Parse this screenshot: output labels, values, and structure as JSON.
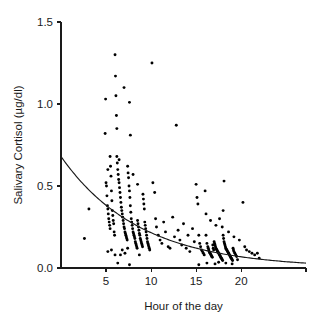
{
  "chart_data": {
    "type": "scatter",
    "title": "",
    "xlabel": "Hour of the day",
    "ylabel": "Salivary Cortisol (µg/dl)",
    "xlim": [
      0,
      27.2
    ],
    "ylim": [
      0.0,
      1.5
    ],
    "xticks": [
      5,
      10,
      15,
      20
    ],
    "xtick_labels": [
      "5",
      "10",
      "15",
      "20"
    ],
    "yticks": [
      0.0,
      0.5,
      1.0,
      1.5
    ],
    "ytick_labels": [
      "0.0",
      "0.5",
      "1.0",
      "1.5"
    ],
    "grid": false,
    "legend": "none",
    "marker": "filled-circle",
    "marker_color": "#000000",
    "fit_curve": {
      "label": "",
      "type": "exponential-decay",
      "color": "#1a1a1a",
      "equation": "y = 0.68 * exp(-0.115 * x)",
      "amplitude": 0.68,
      "decay_rate": 0.115,
      "x_start": 0,
      "x_end": 27.2,
      "y_start": 0.68,
      "y_end": 0.03
    },
    "series": [
      {
        "name": "Salivary cortisol samples",
        "points": [
          [
            2.6,
            0.18
          ],
          [
            3.1,
            0.36
          ],
          [
            4.9,
            0.82
          ],
          [
            4.95,
            1.03
          ],
          [
            5.0,
            0.52
          ],
          [
            5.05,
            0.5
          ],
          [
            5.1,
            0.44
          ],
          [
            5.15,
            0.38
          ],
          [
            5.2,
            0.36
          ],
          [
            5.25,
            0.33
          ],
          [
            5.3,
            0.3
          ],
          [
            5.35,
            0.28
          ],
          [
            5.4,
            0.26
          ],
          [
            5.45,
            0.24
          ],
          [
            5.5,
            0.62
          ],
          [
            5.55,
            0.56
          ],
          [
            5.6,
            0.47
          ],
          [
            5.65,
            0.41
          ],
          [
            5.7,
            0.35
          ],
          [
            5.75,
            0.32
          ],
          [
            5.8,
            0.29
          ],
          [
            5.85,
            0.27
          ],
          [
            5.9,
            0.22
          ],
          [
            5.95,
            0.2
          ],
          [
            6.0,
            1.3
          ],
          [
            6.05,
            1.17
          ],
          [
            6.1,
            1.05
          ],
          [
            6.15,
            0.93
          ],
          [
            6.2,
            0.85
          ],
          [
            6.25,
            0.64
          ],
          [
            6.3,
            0.6
          ],
          [
            6.35,
            0.57
          ],
          [
            6.4,
            0.54
          ],
          [
            6.45,
            0.52
          ],
          [
            6.5,
            0.49
          ],
          [
            6.55,
            0.46
          ],
          [
            6.6,
            0.43
          ],
          [
            6.65,
            0.4
          ],
          [
            6.7,
            0.37
          ],
          [
            6.75,
            0.35
          ],
          [
            6.8,
            0.33
          ],
          [
            6.85,
            0.31
          ],
          [
            6.9,
            0.29
          ],
          [
            6.95,
            0.27
          ],
          [
            7.0,
            0.25
          ],
          [
            7.05,
            0.24
          ],
          [
            7.1,
            0.22
          ],
          [
            7.15,
            0.21
          ],
          [
            7.2,
            0.2
          ],
          [
            7.25,
            0.19
          ],
          [
            7.3,
            0.18
          ],
          [
            7.35,
            0.17
          ],
          [
            7.4,
            0.62
          ],
          [
            7.45,
            0.58
          ],
          [
            7.5,
            0.55
          ],
          [
            7.55,
            0.5
          ],
          [
            7.6,
            0.47
          ],
          [
            7.65,
            0.43
          ],
          [
            7.7,
            0.38
          ],
          [
            7.75,
            0.34
          ],
          [
            7.8,
            0.3
          ],
          [
            7.85,
            0.28
          ],
          [
            7.9,
            0.26
          ],
          [
            7.95,
            0.24
          ],
          [
            8.0,
            0.22
          ],
          [
            8.05,
            0.21
          ],
          [
            8.1,
            0.2
          ],
          [
            8.15,
            0.19
          ],
          [
            8.2,
            0.18
          ],
          [
            8.25,
            0.16
          ],
          [
            8.3,
            0.15
          ],
          [
            8.35,
            0.14
          ],
          [
            8.4,
            0.13
          ],
          [
            8.45,
            0.12
          ],
          [
            8.5,
            0.29
          ],
          [
            8.55,
            0.27
          ],
          [
            8.6,
            0.25
          ],
          [
            8.65,
            0.23
          ],
          [
            8.7,
            0.21
          ],
          [
            8.75,
            0.2
          ],
          [
            8.8,
            0.18
          ],
          [
            8.85,
            0.17
          ],
          [
            8.9,
            0.16
          ],
          [
            8.95,
            0.15
          ],
          [
            9.0,
            0.14
          ],
          [
            9.05,
            0.13
          ],
          [
            9.1,
            0.45
          ],
          [
            9.15,
            0.42
          ],
          [
            9.2,
            0.39
          ],
          [
            9.25,
            0.36
          ],
          [
            9.3,
            0.28
          ],
          [
            9.35,
            0.26
          ],
          [
            9.4,
            0.24
          ],
          [
            9.45,
            0.22
          ],
          [
            9.5,
            0.2
          ],
          [
            9.55,
            0.18
          ],
          [
            9.6,
            0.16
          ],
          [
            9.65,
            0.15
          ],
          [
            9.7,
            0.14
          ],
          [
            9.75,
            0.13
          ],
          [
            9.8,
            0.12
          ],
          [
            9.85,
            0.11
          ],
          [
            6.3,
            0.03
          ],
          [
            7.6,
            0.02
          ],
          [
            6.0,
            0.08
          ],
          [
            6.6,
            0.08
          ],
          [
            7.1,
            0.09
          ],
          [
            5.2,
            0.1
          ],
          [
            5.6,
            0.11
          ],
          [
            6.8,
            0.11
          ],
          [
            7.4,
            0.12
          ],
          [
            8.7,
            0.08
          ],
          [
            7.0,
            1.1
          ],
          [
            7.6,
            1.01
          ],
          [
            7.7,
            0.81
          ],
          [
            6.2,
            0.68
          ],
          [
            6.45,
            0.66
          ],
          [
            5.45,
            0.68
          ],
          [
            5.2,
            0.6
          ],
          [
            8.0,
            0.57
          ],
          [
            8.5,
            0.51
          ],
          [
            10.1,
            1.25
          ],
          [
            10.2,
            0.52
          ],
          [
            10.4,
            0.46
          ],
          [
            10.5,
            0.3
          ],
          [
            10.6,
            0.25
          ],
          [
            10.8,
            0.2
          ],
          [
            11.0,
            0.17
          ],
          [
            11.2,
            0.15
          ],
          [
            11.4,
            0.28
          ],
          [
            11.6,
            0.22
          ],
          [
            11.9,
            0.13
          ],
          [
            12.1,
            0.12
          ],
          [
            12.4,
            0.31
          ],
          [
            12.6,
            0.19
          ],
          [
            12.8,
            0.87
          ],
          [
            13.0,
            0.23
          ],
          [
            13.2,
            0.17
          ],
          [
            13.4,
            0.14
          ],
          [
            13.6,
            0.27
          ],
          [
            13.9,
            0.12
          ],
          [
            14.1,
            0.2
          ],
          [
            14.3,
            0.1
          ],
          [
            14.6,
            0.24
          ],
          [
            14.8,
            0.16
          ],
          [
            15.0,
            0.51
          ],
          [
            15.1,
            0.43
          ],
          [
            15.2,
            0.39
          ],
          [
            15.3,
            0.2
          ],
          [
            15.4,
            0.15
          ],
          [
            15.5,
            0.13
          ],
          [
            15.6,
            0.11
          ],
          [
            15.7,
            0.1
          ],
          [
            15.8,
            0.09
          ],
          [
            15.9,
            0.08
          ],
          [
            16.0,
            0.47
          ],
          [
            16.1,
            0.2
          ],
          [
            16.2,
            0.15
          ],
          [
            16.3,
            0.13
          ],
          [
            16.35,
            0.12
          ],
          [
            16.4,
            0.11
          ],
          [
            16.45,
            0.1
          ],
          [
            16.5,
            0.095
          ],
          [
            16.55,
            0.09
          ],
          [
            16.6,
            0.085
          ],
          [
            16.65,
            0.08
          ],
          [
            16.7,
            0.075
          ],
          [
            16.75,
            0.07
          ],
          [
            16.8,
            0.065
          ],
          [
            16.85,
            0.14
          ],
          [
            16.9,
            0.12
          ],
          [
            16.95,
            0.11
          ],
          [
            17.0,
            0.16
          ],
          [
            17.05,
            0.15
          ],
          [
            17.1,
            0.14
          ],
          [
            17.15,
            0.13
          ],
          [
            17.2,
            0.12
          ],
          [
            17.25,
            0.115
          ],
          [
            17.3,
            0.11
          ],
          [
            17.35,
            0.105
          ],
          [
            17.4,
            0.1
          ],
          [
            17.45,
            0.095
          ],
          [
            17.5,
            0.09
          ],
          [
            17.55,
            0.085
          ],
          [
            17.6,
            0.08
          ],
          [
            17.65,
            0.075
          ],
          [
            17.7,
            0.07
          ],
          [
            17.75,
            0.065
          ],
          [
            17.8,
            0.06
          ],
          [
            17.85,
            0.055
          ],
          [
            17.9,
            0.05
          ],
          [
            17.95,
            0.045
          ],
          [
            18.0,
            0.2
          ],
          [
            18.05,
            0.18
          ],
          [
            18.1,
            0.16
          ],
          [
            18.15,
            0.15
          ],
          [
            18.2,
            0.14
          ],
          [
            18.25,
            0.13
          ],
          [
            18.3,
            0.12
          ],
          [
            18.35,
            0.115
          ],
          [
            18.4,
            0.11
          ],
          [
            18.45,
            0.105
          ],
          [
            18.5,
            0.1
          ],
          [
            18.55,
            0.095
          ],
          [
            18.6,
            0.09
          ],
          [
            18.65,
            0.085
          ],
          [
            18.7,
            0.08
          ],
          [
            18.75,
            0.075
          ],
          [
            18.8,
            0.07
          ],
          [
            18.85,
            0.065
          ],
          [
            18.9,
            0.06
          ],
          [
            18.95,
            0.055
          ],
          [
            19.0,
            0.05
          ],
          [
            19.05,
            0.045
          ],
          [
            19.1,
            0.12
          ],
          [
            19.15,
            0.11
          ],
          [
            19.2,
            0.1
          ],
          [
            19.3,
            0.09
          ],
          [
            19.4,
            0.08
          ],
          [
            19.5,
            0.07
          ],
          [
            19.6,
            0.05
          ],
          [
            18.1,
            0.53
          ],
          [
            18.0,
            0.35
          ],
          [
            17.6,
            0.3
          ],
          [
            17.2,
            0.26
          ],
          [
            16.6,
            0.29
          ],
          [
            16.1,
            0.33
          ],
          [
            17.9,
            0.25
          ],
          [
            18.6,
            0.22
          ],
          [
            19.2,
            0.19
          ],
          [
            19.8,
            0.17
          ],
          [
            20.2,
            0.4
          ],
          [
            20.4,
            0.13
          ],
          [
            20.6,
            0.11
          ],
          [
            20.9,
            0.1
          ],
          [
            21.2,
            0.09
          ],
          [
            21.5,
            0.08
          ],
          [
            21.8,
            0.09
          ],
          [
            22.0,
            0.06
          ],
          [
            15.3,
            0.02
          ],
          [
            16.2,
            0.03
          ],
          [
            17.1,
            0.025
          ],
          [
            18.3,
            0.03
          ],
          [
            19.0,
            0.025
          ],
          [
            17.5,
            0.035
          ]
        ]
      }
    ]
  },
  "geometry": {
    "plot_left": 61,
    "plot_right": 306,
    "plot_top": 22,
    "plot_bottom": 268
  }
}
